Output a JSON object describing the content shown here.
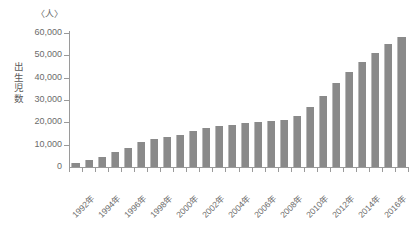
{
  "chart_data": {
    "type": "bar",
    "title": "",
    "subtitle": "",
    "unit_label": "〈人〉",
    "ylabel": "出生児数",
    "xlabel": "",
    "ylim": [
      0,
      60000
    ],
    "ytick_values": [
      0,
      10000,
      20000,
      30000,
      40000,
      50000,
      60000
    ],
    "ytick_labels": [
      "0",
      "10,000",
      "20,000",
      "30,000",
      "40,000",
      "50,000",
      "60,000"
    ],
    "grid": false,
    "legend": "none",
    "bar_color": "#8a8a8a",
    "axis_color": "#9a9a9a",
    "text_color": "#6b6b6b",
    "categories": [
      "1992年",
      "1993年",
      "1994年",
      "1995年",
      "1996年",
      "1997年",
      "1998年",
      "1999年",
      "2000年",
      "2001年",
      "2002年",
      "2003年",
      "2004年",
      "2005年",
      "2006年",
      "2007年",
      "2008年",
      "2009年",
      "2010年",
      "2011年",
      "2012年",
      "2013年",
      "2014年",
      "2015年",
      "2016年",
      "2017年"
    ],
    "xtick_labels_shown": [
      "1992年",
      "1994年",
      "1996年",
      "1998年",
      "2000年",
      "2002年",
      "2004年",
      "2006年",
      "2008年",
      "2010年",
      "2012年",
      "2014年",
      "2016年"
    ],
    "values": [
      2000,
      3000,
      4500,
      6500,
      8500,
      11000,
      12500,
      13500,
      14500,
      16000,
      17500,
      18500,
      19000,
      19500,
      20000,
      20500,
      21000,
      23000,
      27000,
      32000,
      37500,
      42500,
      47000,
      51000,
      55000,
      58000
    ]
  }
}
